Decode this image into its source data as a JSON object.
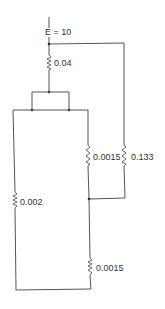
{
  "diagram": {
    "type": "circuit",
    "source": {
      "label": "E = 10"
    },
    "resistors": [
      {
        "id": "r1",
        "label": "0.04"
      },
      {
        "id": "r2",
        "label": "0.0015"
      },
      {
        "id": "r3",
        "label": "0.133"
      },
      {
        "id": "r4",
        "label": "0.002"
      },
      {
        "id": "r5",
        "label": "0.0015"
      }
    ]
  }
}
